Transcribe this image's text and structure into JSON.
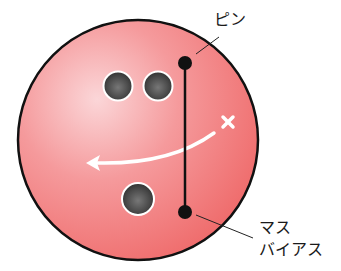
{
  "diagram": {
    "labels": {
      "pin": "ピン",
      "mass_bias_line1": "マス",
      "mass_bias_line2": "バイアス"
    },
    "colors": {
      "ball": "#f07676",
      "ball_highlight": "#fbd2d4",
      "outline": "#111111",
      "hole": "#4a4a4a",
      "arrow": "#ffffff"
    },
    "elements": {
      "finger_holes": 2,
      "thumb_holes": 1,
      "markers": [
        "pin",
        "mass-bias"
      ],
      "rotation_arrow": "curved arrow from X mark sweeping left"
    }
  }
}
